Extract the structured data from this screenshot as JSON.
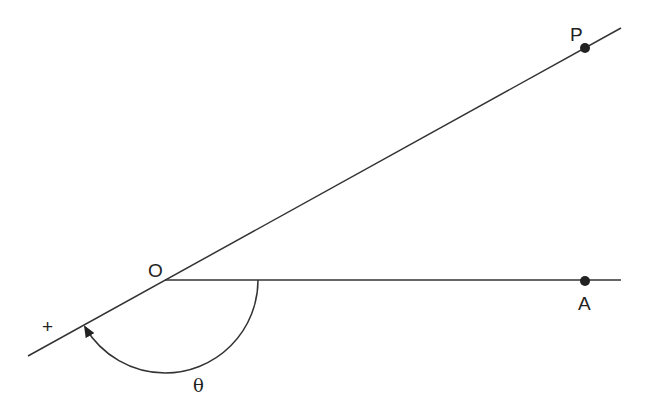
{
  "diagram": {
    "type": "polar-angle",
    "colors": {
      "stroke": "#333333",
      "text": "#222222",
      "background": "#ffffff"
    },
    "points": {
      "origin": {
        "label": "O"
      },
      "P": {
        "label": "P"
      },
      "A": {
        "label": "A"
      }
    },
    "angle": {
      "label": "θ",
      "direction_symbol": "+"
    }
  }
}
